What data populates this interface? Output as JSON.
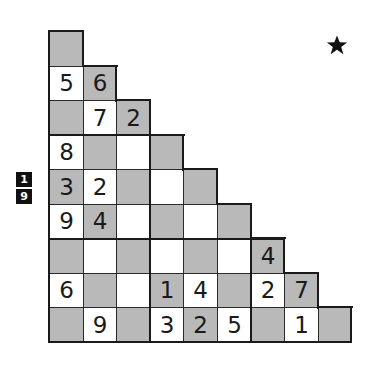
{
  "puzzle": {
    "type": "staircase-sudoku",
    "size": 9,
    "grid_origin": {
      "x": 49,
      "y": 31
    },
    "cell_size": {
      "w": 33.6,
      "h": 34.5
    },
    "colors": {
      "shaded": "#b9b9b9",
      "white": "#ffffff",
      "border": "#2a2a2a",
      "digit": "#1a1a1a"
    },
    "rows": [
      [
        {
          "s": 1,
          "v": ""
        }
      ],
      [
        {
          "s": 0,
          "v": "5"
        },
        {
          "s": 1,
          "v": "6"
        }
      ],
      [
        {
          "s": 1,
          "v": ""
        },
        {
          "s": 0,
          "v": "7"
        },
        {
          "s": 1,
          "v": "2"
        }
      ],
      [
        {
          "s": 0,
          "v": "8"
        },
        {
          "s": 1,
          "v": ""
        },
        {
          "s": 0,
          "v": ""
        },
        {
          "s": 1,
          "v": ""
        }
      ],
      [
        {
          "s": 1,
          "v": "3"
        },
        {
          "s": 0,
          "v": "2"
        },
        {
          "s": 1,
          "v": ""
        },
        {
          "s": 0,
          "v": ""
        },
        {
          "s": 1,
          "v": ""
        }
      ],
      [
        {
          "s": 0,
          "v": "9"
        },
        {
          "s": 1,
          "v": "4"
        },
        {
          "s": 0,
          "v": ""
        },
        {
          "s": 1,
          "v": ""
        },
        {
          "s": 0,
          "v": ""
        },
        {
          "s": 1,
          "v": ""
        }
      ],
      [
        {
          "s": 1,
          "v": ""
        },
        {
          "s": 0,
          "v": ""
        },
        {
          "s": 1,
          "v": ""
        },
        {
          "s": 0,
          "v": ""
        },
        {
          "s": 1,
          "v": ""
        },
        {
          "s": 0,
          "v": ""
        },
        {
          "s": 1,
          "v": "4"
        }
      ],
      [
        {
          "s": 0,
          "v": "6"
        },
        {
          "s": 1,
          "v": ""
        },
        {
          "s": 0,
          "v": ""
        },
        {
          "s": 1,
          "v": "1"
        },
        {
          "s": 0,
          "v": "4"
        },
        {
          "s": 1,
          "v": ""
        },
        {
          "s": 0,
          "v": "2"
        },
        {
          "s": 1,
          "v": "7"
        }
      ],
      [
        {
          "s": 1,
          "v": ""
        },
        {
          "s": 0,
          "v": "9"
        },
        {
          "s": 1,
          "v": ""
        },
        {
          "s": 0,
          "v": "3"
        },
        {
          "s": 1,
          "v": "2"
        },
        {
          "s": 0,
          "v": "5"
        },
        {
          "s": 1,
          "v": ""
        },
        {
          "s": 0,
          "v": "1"
        },
        {
          "s": 1,
          "v": ""
        }
      ]
    ]
  },
  "difficulty_badge": {
    "top": "1",
    "bottom": "9"
  },
  "rating": {
    "icon": "star-icon",
    "glyph": "★",
    "color": "#111111"
  }
}
